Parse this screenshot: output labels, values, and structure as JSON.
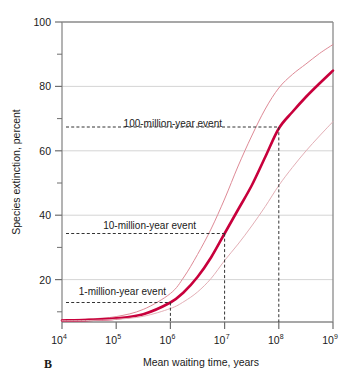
{
  "panel": {
    "label": "B"
  },
  "chart_data": {
    "type": "line",
    "title": "",
    "xlabel": "Mean waiting time, years",
    "ylabel": "Species extinction, percent",
    "xscale": "log",
    "xlim": [
      10000,
      1000000000
    ],
    "ylim": [
      0,
      100
    ],
    "grid": true,
    "legend": "none",
    "x_ticks": [
      {
        "value": 10000,
        "base": "10",
        "exp": "4"
      },
      {
        "value": 100000,
        "base": "10",
        "exp": "5"
      },
      {
        "value": 1000000,
        "base": "10",
        "exp": "6"
      },
      {
        "value": 10000000,
        "base": "10",
        "exp": "7"
      },
      {
        "value": 100000000,
        "base": "10",
        "exp": "8"
      },
      {
        "value": 1000000000,
        "base": "10",
        "exp": "9"
      }
    ],
    "y_ticks_major": [
      20,
      40,
      60,
      80,
      100
    ],
    "y_ticks_minor": [
      10,
      30,
      50,
      70,
      90
    ],
    "x": [
      10000,
      31623,
      100000,
      316228,
      1000000,
      1778279,
      3162278,
      5623413,
      10000000,
      17782794,
      31622777,
      56234133,
      100000000,
      177827941,
      316227766,
      562341325,
      1000000000
    ],
    "series": [
      {
        "name": "upper bound",
        "color": "#DE8A96",
        "width": 1.0,
        "values": [
          0.6,
          1.0,
          1.8,
          4.2,
          9.5,
          15.0,
          22.5,
          31.0,
          41.0,
          52.0,
          62.0,
          71.0,
          78.0,
          82.5,
          86.0,
          89.5,
          92.5
        ]
      },
      {
        "name": "best estimate",
        "color": "#C8003C",
        "width": 2.6,
        "values": [
          0.5,
          0.7,
          1.2,
          2.6,
          6.5,
          10.0,
          15.0,
          21.5,
          29.5,
          37.5,
          45.5,
          55.0,
          64.5,
          70.0,
          75.0,
          79.5,
          83.8
        ]
      },
      {
        "name": "lower bound",
        "color": "#E3AFB6",
        "width": 1.0,
        "values": [
          0.4,
          0.5,
          0.9,
          1.9,
          4.5,
          6.8,
          10.0,
          14.5,
          20.5,
          26.0,
          32.0,
          38.5,
          45.5,
          51.5,
          57.0,
          62.0,
          66.8
        ]
      }
    ],
    "annotations": [
      {
        "label": "100-million-year event",
        "x": 100000000,
        "y": 65,
        "guide": "dashed"
      },
      {
        "label": "10-million-year event",
        "x": 10000000,
        "y": 29.5,
        "guide": "dashed"
      },
      {
        "label": "1-million-year event",
        "x": 1000000,
        "y": 6.5,
        "guide": "dashed"
      }
    ],
    "colors": {
      "main_curve": "#C8003C",
      "upper_curve": "#DE8A96",
      "lower_curve": "#E3AFB6",
      "axis": "#8a8a8a",
      "grid": "#c9c9c9",
      "dashed_guide": "#333333",
      "background": "#ffffff"
    }
  }
}
